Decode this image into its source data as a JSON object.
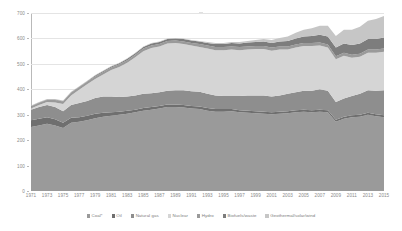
{
  "chart_data": {
    "type": "area",
    "stacked": true,
    "title": "",
    "subtitle": "",
    "xlabel": "",
    "ylabel": "",
    "ylim": [
      0,
      700
    ],
    "xlim": [
      1971,
      2015
    ],
    "grid": true,
    "legend_position": "bottom",
    "y_ticks": [
      0,
      100,
      200,
      300,
      400,
      500,
      600,
      700
    ],
    "y_tick_labels": [
      "0",
      "100",
      "200",
      "300",
      "400",
      "500",
      "600",
      "700"
    ],
    "x_tick_labels": [
      "1971",
      "1973",
      "1975",
      "1977",
      "1979",
      "1981",
      "1983",
      "1985",
      "1987",
      "1989",
      "1991",
      "1993",
      "1995",
      "1997",
      "1999",
      "2001",
      "2003",
      "2005",
      "2007",
      "2009",
      "2011",
      "2013",
      "2015"
    ],
    "x": [
      1971,
      1972,
      1973,
      1974,
      1975,
      1976,
      1977,
      1978,
      1979,
      1980,
      1981,
      1982,
      1983,
      1984,
      1985,
      1986,
      1987,
      1988,
      1989,
      1990,
      1991,
      1992,
      1993,
      1994,
      1995,
      1996,
      1997,
      1998,
      1999,
      2000,
      2001,
      2002,
      2003,
      2004,
      2005,
      2006,
      2007,
      2008,
      2009,
      2010,
      2011,
      2012,
      2013,
      2014,
      2015
    ],
    "series": [
      {
        "name": "Coal*",
        "color": "#9a9a9a",
        "values": [
          252,
          258,
          264,
          258,
          248,
          268,
          272,
          278,
          286,
          292,
          296,
          300,
          304,
          310,
          316,
          320,
          324,
          330,
          330,
          328,
          324,
          322,
          316,
          312,
          312,
          314,
          310,
          308,
          306,
          304,
          302,
          304,
          306,
          310,
          312,
          310,
          312,
          310,
          272,
          284,
          290,
          292,
          300,
          294,
          290
        ]
      },
      {
        "name": "Oil",
        "color": "#6f6f6f",
        "values": [
          26,
          26,
          26,
          24,
          20,
          20,
          18,
          18,
          18,
          16,
          14,
          12,
          12,
          10,
          10,
          10,
          10,
          10,
          10,
          10,
          10,
          10,
          10,
          10,
          10,
          8,
          8,
          8,
          8,
          8,
          8,
          8,
          8,
          8,
          8,
          8,
          8,
          8,
          8,
          8,
          8,
          8,
          8,
          8,
          8
        ]
      },
      {
        "name": "Natural gas",
        "color": "#8e8e8e",
        "values": [
          42,
          46,
          48,
          48,
          46,
          50,
          56,
          58,
          62,
          64,
          62,
          58,
          56,
          56,
          56,
          54,
          54,
          54,
          56,
          58,
          58,
          58,
          56,
          54,
          52,
          52,
          56,
          60,
          62,
          64,
          62,
          64,
          68,
          70,
          74,
          76,
          80,
          76,
          70,
          72,
          76,
          82,
          88,
          92,
          98
        ]
      },
      {
        "name": "Nuclear",
        "color": "#d5d5d5",
        "values": [
          4,
          8,
          12,
          18,
          28,
          38,
          52,
          66,
          74,
          86,
          104,
          118,
          132,
          150,
          168,
          178,
          180,
          186,
          186,
          182,
          180,
          176,
          178,
          178,
          180,
          182,
          180,
          180,
          182,
          182,
          180,
          180,
          174,
          176,
          176,
          176,
          172,
          170,
          168,
          168,
          150,
          146,
          148,
          150,
          152
        ]
      },
      {
        "name": "Hydro",
        "color": "#9a9a9a",
        "values": [
          8,
          8,
          8,
          10,
          10,
          10,
          10,
          10,
          10,
          10,
          10,
          10,
          10,
          10,
          10,
          10,
          10,
          10,
          10,
          10,
          10,
          12,
          12,
          12,
          12,
          12,
          12,
          12,
          12,
          12,
          12,
          12,
          12,
          12,
          12,
          12,
          12,
          12,
          12,
          12,
          12,
          12,
          12,
          12,
          12
        ]
      },
      {
        "name": "Biofuels/waste",
        "color": "#7d7d7d",
        "values": [
          2,
          2,
          2,
          2,
          2,
          2,
          2,
          2,
          4,
          4,
          4,
          4,
          6,
          6,
          6,
          8,
          8,
          8,
          8,
          10,
          10,
          10,
          10,
          12,
          12,
          14,
          14,
          16,
          16,
          18,
          18,
          20,
          22,
          24,
          26,
          28,
          30,
          32,
          34,
          36,
          38,
          40,
          42,
          42,
          44
        ]
      },
      {
        "name": "Geothermal/solar/wind",
        "color": "#c6c6c6",
        "values": [
          2,
          2,
          2,
          2,
          2,
          2,
          2,
          2,
          2,
          2,
          2,
          2,
          2,
          2,
          2,
          2,
          2,
          2,
          2,
          2,
          2,
          2,
          4,
          4,
          4,
          4,
          6,
          6,
          8,
          10,
          12,
          14,
          18,
          22,
          26,
          30,
          36,
          42,
          46,
          54,
          60,
          66,
          72,
          78,
          84
        ]
      }
    ]
  },
  "legend": {
    "items": [
      {
        "label": "Coal*"
      },
      {
        "label": "Oil"
      },
      {
        "label": "Natural gas"
      },
      {
        "label": "Nuclear"
      },
      {
        "label": "Hydro"
      },
      {
        "label": "Biofuels/waste"
      },
      {
        "label": "Geothermal/solar/wind"
      }
    ]
  }
}
